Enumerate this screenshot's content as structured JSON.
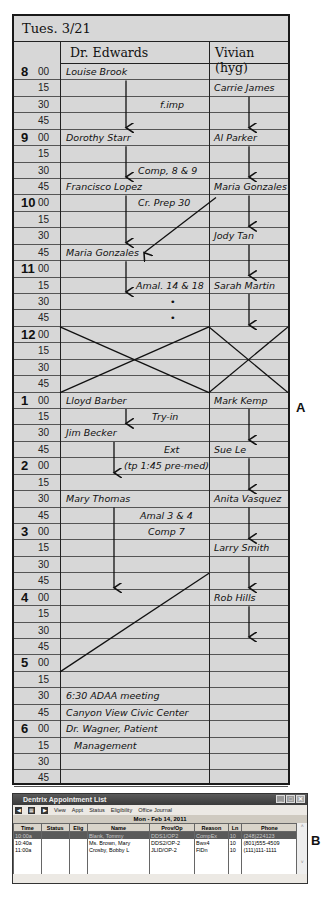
{
  "schedule": {
    "date": "Tues. 3/21",
    "columns": [
      "Dr. Edwards",
      "Vivian (hyg)"
    ],
    "times": [
      {
        "hour": "8",
        "min": "00"
      },
      {
        "hour": "",
        "min": "15"
      },
      {
        "hour": "",
        "min": "30"
      },
      {
        "hour": "",
        "min": "45"
      },
      {
        "hour": "9",
        "min": "00"
      },
      {
        "hour": "",
        "min": "15"
      },
      {
        "hour": "",
        "min": "30"
      },
      {
        "hour": "",
        "min": "45"
      },
      {
        "hour": "10",
        "min": "00"
      },
      {
        "hour": "",
        "min": "15"
      },
      {
        "hour": "",
        "min": "30"
      },
      {
        "hour": "",
        "min": "45"
      },
      {
        "hour": "11",
        "min": "00"
      },
      {
        "hour": "",
        "min": "15"
      },
      {
        "hour": "",
        "min": "30"
      },
      {
        "hour": "",
        "min": "45"
      },
      {
        "hour": "12",
        "min": "00"
      },
      {
        "hour": "",
        "min": "15"
      },
      {
        "hour": "",
        "min": "30"
      },
      {
        "hour": "",
        "min": "45"
      },
      {
        "hour": "1",
        "min": "00"
      },
      {
        "hour": "",
        "min": "15"
      },
      {
        "hour": "",
        "min": "30"
      },
      {
        "hour": "",
        "min": "45"
      },
      {
        "hour": "2",
        "min": "00"
      },
      {
        "hour": "",
        "min": "15"
      },
      {
        "hour": "",
        "min": "30"
      },
      {
        "hour": "",
        "min": "45"
      },
      {
        "hour": "3",
        "min": "00"
      },
      {
        "hour": "",
        "min": "15"
      },
      {
        "hour": "",
        "min": "30"
      },
      {
        "hour": "",
        "min": "45"
      },
      {
        "hour": "4",
        "min": "00"
      },
      {
        "hour": "",
        "min": "15"
      },
      {
        "hour": "",
        "min": "30"
      },
      {
        "hour": "",
        "min": "45"
      },
      {
        "hour": "5",
        "min": "00"
      },
      {
        "hour": "",
        "min": "15"
      },
      {
        "hour": "",
        "min": "30"
      },
      {
        "hour": "",
        "min": "45"
      },
      {
        "hour": "6",
        "min": "00"
      },
      {
        "hour": "",
        "min": "15"
      },
      {
        "hour": "",
        "min": "30"
      },
      {
        "hour": "",
        "min": "45"
      }
    ],
    "edwards": [
      {
        "row": 0,
        "text": "Louise Brook",
        "x": 6
      },
      {
        "row": 2,
        "text": "f.imp",
        "x": 100
      },
      {
        "row": 4,
        "text": "Dorothy Starr",
        "x": 6
      },
      {
        "row": 6,
        "text": "Comp, 8 & 9",
        "x": 78
      },
      {
        "row": 7,
        "text": "Francisco Lopez",
        "x": 6
      },
      {
        "row": 8,
        "text": "Cr. Prep 30",
        "x": 78
      },
      {
        "row": 11,
        "text": "Maria Gonzales",
        "x": 6
      },
      {
        "row": 13,
        "text": "Amal. 14 & 18",
        "x": 76
      },
      {
        "row": 14,
        "text": "•",
        "x": 110
      },
      {
        "row": 15,
        "text": "•",
        "x": 110
      },
      {
        "row": 20,
        "text": "Lloyd Barber",
        "x": 6
      },
      {
        "row": 21,
        "text": "Try-in",
        "x": 92
      },
      {
        "row": 22,
        "text": "Jim Becker",
        "x": 6
      },
      {
        "row": 23,
        "text": "Ext",
        "x": 104
      },
      {
        "row": 24,
        "text": "(tp 1:45 pre-med)",
        "x": 64
      },
      {
        "row": 26,
        "text": "Mary Thomas",
        "x": 6
      },
      {
        "row": 27,
        "text": "Amal 3 & 4",
        "x": 80
      },
      {
        "row": 28,
        "text": "Comp 7",
        "x": 88
      },
      {
        "row": 38,
        "text": "6:30 ADAA meeting",
        "x": 6
      },
      {
        "row": 39,
        "text": "Canyon View Civic Center",
        "x": 6
      },
      {
        "row": 40,
        "text": "Dr. Wagner, Patient",
        "x": 6
      },
      {
        "row": 41,
        "text": "Management",
        "x": 14
      }
    ],
    "vivian": [
      {
        "row": 1,
        "text": "Carrie James"
      },
      {
        "row": 4,
        "text": "Al Parker"
      },
      {
        "row": 7,
        "text": "Maria Gonzales"
      },
      {
        "row": 10,
        "text": "Jody Tan"
      },
      {
        "row": 13,
        "text": "Sarah Martin"
      },
      {
        "row": 20,
        "text": "Mark Kemp"
      },
      {
        "row": 23,
        "text": "Sue Le"
      },
      {
        "row": 26,
        "text": "Anita Vasquez"
      },
      {
        "row": 29,
        "text": "Larry Smith"
      },
      {
        "row": 32,
        "text": "Rob Hills"
      }
    ]
  },
  "labels": {
    "a": "A",
    "b": "B"
  },
  "window": {
    "title": "Dentrix Appointment List",
    "menu": [
      "View",
      "Appt",
      "Status",
      "Eligibility",
      "Office Journal"
    ],
    "date": "Mon - Feb 14, 2011",
    "columns": [
      "Time",
      "Status",
      "Elig",
      "Name",
      "Prov/Op",
      "Reason",
      "Ln",
      "Phone"
    ],
    "rows": [
      {
        "time": "10:00a",
        "status": "",
        "elig": "",
        "name": "Blank, Tommy",
        "prov": "DDS1/OP2",
        "reason": "CompEx",
        "ln": "10",
        "phone": "(248)224123"
      },
      {
        "time": "10:40a",
        "status": "",
        "elig": "",
        "name": "Ms. Brown, Mary",
        "prov": "DDS2/OP-2",
        "reason": "Bwx4",
        "ln": "10",
        "phone": "(801)555-4509"
      },
      {
        "time": "11:00a",
        "status": "",
        "elig": "",
        "name": "Crosby, Bobby L",
        "prov": "JLID/OP-2",
        "reason": "FlDn",
        "ln": "10",
        "phone": "(111)111-1111"
      }
    ]
  }
}
